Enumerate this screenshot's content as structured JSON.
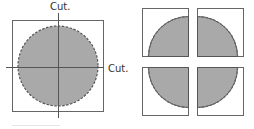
{
  "diagram": {
    "left_panel": {
      "cut_label_top": "Cut.",
      "cut_label_right": "Cut."
    },
    "right_panel": {
      "pieces": [
        "top-left quadrant",
        "top-right quadrant",
        "bottom-left quadrant",
        "bottom-right quadrant"
      ]
    },
    "colors": {
      "fill": "#a9a9a9",
      "stroke": "#555555",
      "frame": "#666666",
      "dash": "#666666"
    }
  }
}
